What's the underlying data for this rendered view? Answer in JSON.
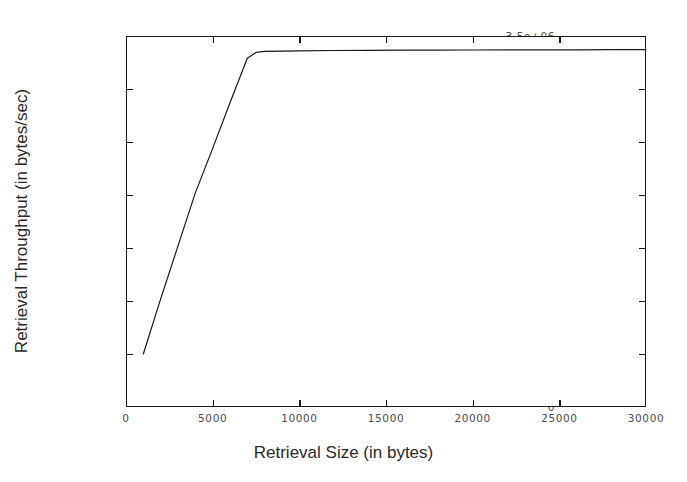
{
  "chart_data": {
    "type": "line",
    "title": "",
    "xlabel": "Retrieval Size (in bytes)",
    "ylabel": "Retrieval Throughput (in bytes/sec)",
    "xlim": [
      0,
      30000
    ],
    "ylim": [
      0,
      3500000
    ],
    "grid": false,
    "legend": null,
    "xticks": [
      0,
      5000,
      10000,
      15000,
      20000,
      25000,
      30000
    ],
    "xticklabels": [
      "0",
      "5000",
      "10000",
      "15000",
      "20000",
      "25000",
      "30000"
    ],
    "yticks": [
      0,
      500000,
      1000000,
      1500000,
      2000000,
      2500000,
      3000000,
      3500000
    ],
    "yticklabels": [
      "0",
      "500000",
      "1e+06",
      "1.5e+06",
      "2e+06",
      "2.5e+06",
      "3e+06",
      "3.5e+06"
    ],
    "line_color": "#1a1a1a",
    "series": [
      {
        "name": "Retrieval Throughput",
        "x": [
          1000,
          2000,
          3000,
          4000,
          5000,
          6000,
          7000,
          7500,
          8000,
          9000,
          10000,
          12000,
          14000,
          16000,
          18000,
          20000,
          22000,
          24000,
          26000,
          28000,
          30000
        ],
        "y": [
          500000,
          1020000,
          1520000,
          2020000,
          2440000,
          2870000,
          3290000,
          3345000,
          3355000,
          3358000,
          3360000,
          3363000,
          3365000,
          3366000,
          3367000,
          3368000,
          3369000,
          3370000,
          3370000,
          3371000,
          3371000
        ]
      }
    ]
  }
}
